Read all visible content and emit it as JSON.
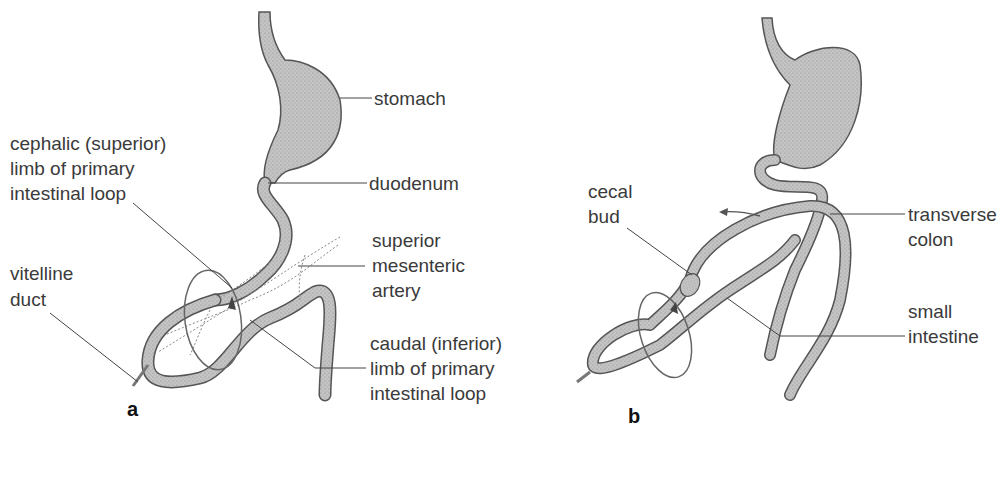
{
  "panel_a": {
    "letter": "a",
    "labels": {
      "stomach": "stomach",
      "duodenum": "duodenum",
      "cephalic_1": "cephalic (superior)",
      "cephalic_2": "limb of primary",
      "cephalic_3": "intestinal loop",
      "sma_1": "superior",
      "sma_2": "mesenteric",
      "sma_3": "artery",
      "vitelline_1": "vitelline",
      "vitelline_2": "duct",
      "caudal_1": "caudal (inferior)",
      "caudal_2": "limb of primary",
      "caudal_3": "intestinal loop"
    }
  },
  "panel_b": {
    "letter": "b",
    "labels": {
      "cecal_1": "cecal",
      "cecal_2": "bud",
      "transverse_1": "transverse",
      "transverse_2": "colon",
      "small_1": "small",
      "small_2": "intestine"
    }
  },
  "colors": {
    "gut_fill": "#b8b8b8",
    "gut_stroke": "#555555",
    "leader": "#444444",
    "text": "#3a3a3a"
  }
}
